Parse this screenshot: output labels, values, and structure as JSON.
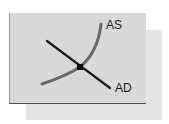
{
  "diagram": {
    "type": "aggregate-supply-aggregate-demand",
    "curves": [
      {
        "id": "AS",
        "label": "AS",
        "shape": "upward-sloping convex curve",
        "color": "#6a6a6a"
      },
      {
        "id": "AD",
        "label": "AD",
        "shape": "downward-sloping straight line",
        "color": "#1c1c1c"
      }
    ],
    "equilibrium_point": {
      "label": "",
      "color": "#000000"
    },
    "colors": {
      "front_panel": "#d9d9d9",
      "back_panel": "#e4e4e4",
      "as_curve": "#6a6a6a",
      "ad_line": "#1c1c1c"
    }
  }
}
